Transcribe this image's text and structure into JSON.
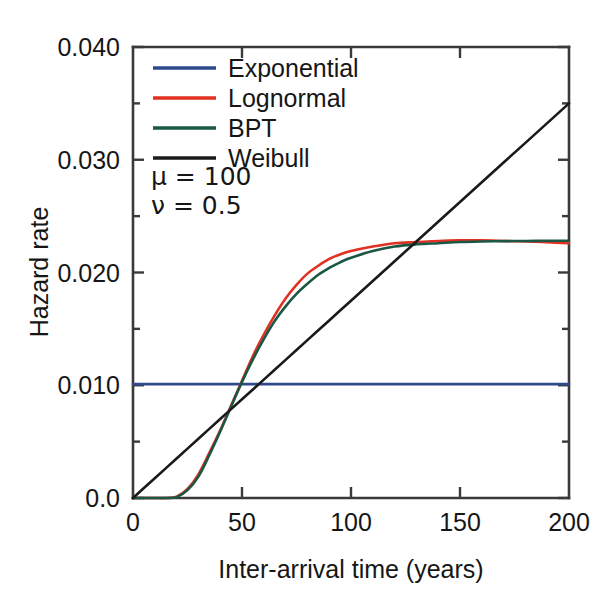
{
  "figure": {
    "kind": "scientific-line-plot",
    "background": "#ffffff"
  },
  "chart_data": {
    "type": "line",
    "title": "",
    "xlabel": "Inter-arrival time (years)",
    "ylabel": "Hazard rate",
    "xlim": [
      0,
      200
    ],
    "ylim": [
      0,
      0.04
    ],
    "grid": false,
    "legend_position": "top-left inside axes",
    "xticks": [
      0,
      50,
      100,
      150,
      200
    ],
    "xtick_labels": [
      "0",
      "50",
      "100",
      "150",
      "200"
    ],
    "yticks": [
      0,
      0.005,
      0.01,
      0.015,
      0.02,
      0.025,
      0.03,
      0.035,
      0.04
    ],
    "ytick_labels": [
      "0.0",
      "0.005",
      "0.010",
      "0.015",
      "0.020",
      "0.025",
      "0.030",
      "0.035",
      "0.040"
    ],
    "annotations": [
      {
        "name": "mu",
        "text": "μ = 100",
        "symbol": "μ",
        "value": "100"
      },
      {
        "name": "nu",
        "text": "ν = 0.5",
        "symbol": "ν",
        "value": "0.5"
      }
    ],
    "x": [
      0,
      5,
      10,
      15,
      20,
      25,
      30,
      35,
      40,
      45,
      50,
      55,
      60,
      65,
      70,
      75,
      80,
      85,
      90,
      95,
      100,
      110,
      120,
      130,
      140,
      150,
      160,
      170,
      180,
      190,
      200
    ],
    "series": [
      {
        "name": "Exponential",
        "color": "#2E4A8C",
        "values": [
          0.0101,
          0.0101,
          0.0101,
          0.0101,
          0.0101,
          0.0101,
          0.0101,
          0.0101,
          0.0101,
          0.0101,
          0.0101,
          0.0101,
          0.0101,
          0.0101,
          0.0101,
          0.0101,
          0.0101,
          0.0101,
          0.0101,
          0.0101,
          0.0101,
          0.0101,
          0.0101,
          0.0101,
          0.0101,
          0.0101,
          0.0101,
          0.0101,
          0.0101,
          0.0101,
          0.0101
        ]
      },
      {
        "name": "Lognormal",
        "color": "#E03122",
        "values": [
          0.0,
          0.0,
          0.0,
          0.0,
          0.00012,
          0.0008,
          0.0021,
          0.004,
          0.006,
          0.0082,
          0.0104,
          0.0126,
          0.0145,
          0.0162,
          0.0177,
          0.0189,
          0.0199,
          0.0206,
          0.0212,
          0.0216,
          0.0219,
          0.0223,
          0.0226,
          0.0227,
          0.0228,
          0.02285,
          0.02285,
          0.0228,
          0.02275,
          0.02268,
          0.0226
        ]
      },
      {
        "name": "BPT",
        "color": "#1A5744",
        "values": [
          0.0,
          0.0,
          0.0,
          0.0,
          8e-05,
          0.0007,
          0.0019,
          0.0038,
          0.0059,
          0.0081,
          0.0103,
          0.0123,
          0.0141,
          0.0157,
          0.017,
          0.0181,
          0.019,
          0.0198,
          0.0204,
          0.0209,
          0.0213,
          0.0219,
          0.0223,
          0.0225,
          0.0226,
          0.0227,
          0.02275,
          0.02278,
          0.0228,
          0.02281,
          0.02282
        ]
      },
      {
        "name": "Weibull",
        "color": "#1a1a1a",
        "values": [
          0.0,
          0.00088,
          0.00175,
          0.00263,
          0.0035,
          0.00438,
          0.00525,
          0.00613,
          0.007,
          0.00788,
          0.00875,
          0.00963,
          0.0105,
          0.01138,
          0.01225,
          0.01313,
          0.014,
          0.01488,
          0.01575,
          0.01663,
          0.0175,
          0.01925,
          0.021,
          0.02275,
          0.0245,
          0.02625,
          0.028,
          0.02975,
          0.0315,
          0.03325,
          0.035
        ]
      }
    ]
  },
  "legend": {
    "entries": [
      {
        "label": "Exponential",
        "color": "#2E4A8C"
      },
      {
        "label": "Lognormal",
        "color": "#E03122"
      },
      {
        "label": "BPT",
        "color": "#1A5744"
      },
      {
        "label": "Weibull",
        "color": "#1a1a1a"
      }
    ]
  }
}
